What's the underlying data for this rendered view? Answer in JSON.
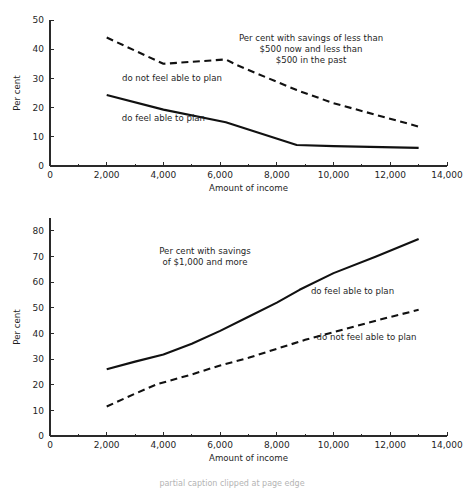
{
  "figure": {
    "background": "#ffffff",
    "ink_color": "#111111",
    "axis_color": "#2a2a2a",
    "partial_caption": "partial caption clipped at page edge"
  },
  "chart_data": [
    {
      "id": "top",
      "type": "line",
      "title": "",
      "annotation_title": "Per cent with savings of less than\n$500 now and less than\n$500 in the past",
      "annotation_title_lines": [
        "Per cent with savings of less than",
        "$500 now and less than",
        "$500 in the past"
      ],
      "xlabel": "Amount of income",
      "ylabel": "Per cent",
      "xlim": [
        0,
        14000
      ],
      "ylim": [
        0,
        50
      ],
      "xticks": [
        0,
        2000,
        4000,
        6000,
        8000,
        10000,
        12000,
        14000
      ],
      "xticklabels": [
        "0",
        "2,000",
        "4,000",
        "6,000",
        "8,000",
        "10,000",
        "12,000",
        "14,000"
      ],
      "xminorticks": [
        1000,
        3000,
        5000,
        7000,
        9000,
        11000,
        13000
      ],
      "yticks": [
        0,
        10,
        20,
        30,
        40,
        50
      ],
      "yticklabels": [
        "0",
        "10",
        "20",
        "30",
        "40",
        "50"
      ],
      "grid": false,
      "legend_position": "inline-annotations",
      "series": [
        {
          "name": "do not feel able to plan",
          "style": "dashed",
          "label_x": 4300,
          "label_y": 29,
          "label_anchor": "middle",
          "x": [
            2000,
            4000,
            6200,
            6600,
            8700,
            10000,
            13000
          ],
          "values": [
            44.0,
            35.0,
            36.5,
            34.5,
            26.0,
            21.5,
            13.5
          ]
        },
        {
          "name": "do feel able to plan",
          "style": "solid",
          "label_x": 4000,
          "label_y": 15.5,
          "label_anchor": "middle",
          "x": [
            2000,
            4000,
            6200,
            8700,
            10000,
            13000
          ],
          "values": [
            24.3,
            19.3,
            15.0,
            7.2,
            6.8,
            6.2
          ]
        }
      ]
    },
    {
      "id": "bottom",
      "type": "line",
      "title": "",
      "annotation_title": "Per cent with savings\nof $1,000 and more",
      "annotation_title_lines": [
        "Per cent with savings",
        "of $1,000 and more"
      ],
      "xlabel": "Amount of income",
      "ylabel": "Per cent",
      "xlim": [
        0,
        14000
      ],
      "ylim": [
        0,
        85
      ],
      "xticks": [
        0,
        2000,
        4000,
        6000,
        8000,
        10000,
        12000,
        14000
      ],
      "xticklabels": [
        "0",
        "2,000",
        "4,000",
        "6,000",
        "8,000",
        "10,000",
        "12,000",
        "14,000"
      ],
      "xminorticks": [
        1000,
        3000,
        5000,
        7000,
        9000,
        11000,
        13000
      ],
      "yticks": [
        10,
        20,
        30,
        40,
        50,
        60,
        70,
        80
      ],
      "yticklabels": [
        "10",
        "20",
        "30",
        "40",
        "50",
        "60",
        "70",
        "80"
      ],
      "ytick_zero_label": "0",
      "grid": false,
      "legend_position": "inline-annotations",
      "series": [
        {
          "name": "do feel able to plan",
          "style": "solid",
          "label_x": 9200,
          "label_y": 55.5,
          "label_anchor": "start",
          "x": [
            2000,
            3000,
            4000,
            5000,
            6000,
            7000,
            8000,
            8800,
            10000,
            11500,
            13000
          ],
          "values": [
            26.0,
            29.0,
            31.8,
            36.0,
            41.0,
            46.5,
            52.0,
            57.0,
            63.5,
            70.0,
            76.8
          ]
        },
        {
          "name": "do not feel able to plan",
          "style": "dashed",
          "label_x": 9400,
          "label_y": 37.5,
          "label_anchor": "start",
          "x": [
            2000,
            3000,
            3800,
            4200,
            5000,
            6000,
            7000,
            8000,
            9000,
            10000,
            11500,
            13000
          ],
          "values": [
            11.5,
            16.5,
            20.3,
            21.5,
            24.0,
            27.5,
            30.5,
            34.0,
            37.5,
            40.5,
            45.0,
            49.2
          ]
        }
      ]
    }
  ]
}
